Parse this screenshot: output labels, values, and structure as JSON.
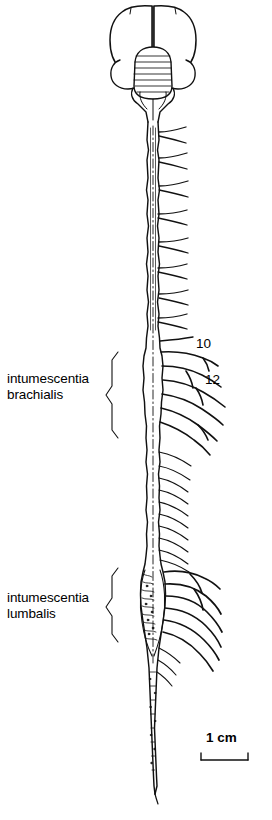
{
  "figure": {
    "type": "anatomical-line-drawing",
    "labels": {
      "brachialis_line1": "intumescentia",
      "brachialis_line2": "brachialis",
      "lumbalis_line1": "intumescentia",
      "lumbalis_line2": "lumbalis"
    },
    "callouts": {
      "num_10": "10",
      "num_12": "12"
    },
    "scalebar": {
      "text": "1 cm"
    },
    "colors": {
      "ink": "#000000",
      "background": "#ffffff"
    }
  }
}
